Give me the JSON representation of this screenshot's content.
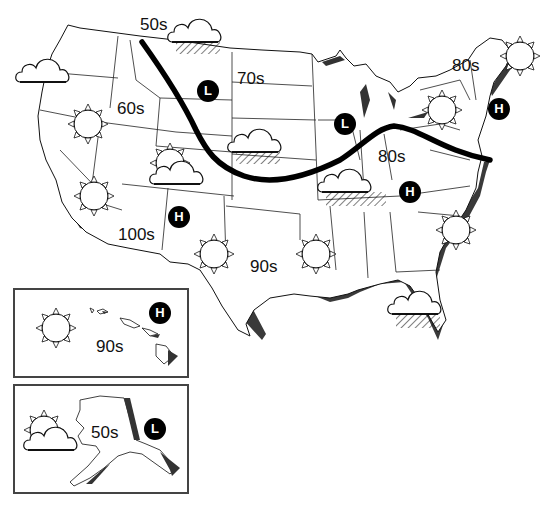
{
  "map": {
    "title": "",
    "temperature_labels": [
      {
        "id": "nw-50s",
        "text": "50s",
        "x": 140,
        "y": 16
      },
      {
        "id": "northplains-70s",
        "text": "70s",
        "x": 237,
        "y": 70
      },
      {
        "id": "northeast-80s",
        "text": "80s",
        "x": 452,
        "y": 57
      },
      {
        "id": "northwest-60s",
        "text": "60s",
        "x": 117,
        "y": 100
      },
      {
        "id": "midwest-80s",
        "text": "80s",
        "x": 378,
        "y": 148
      },
      {
        "id": "southwest-100s",
        "text": "100s",
        "x": 118,
        "y": 226
      },
      {
        "id": "south-90s",
        "text": "90s",
        "x": 250,
        "y": 258
      },
      {
        "id": "hawaii-90s",
        "text": "90s",
        "x": 96,
        "y": 338
      },
      {
        "id": "alaska-50s",
        "text": "50s",
        "x": 91,
        "y": 424
      }
    ],
    "pressure_systems": [
      {
        "id": "low-northplains",
        "type": "L",
        "x": 197,
        "y": 80
      },
      {
        "id": "low-greatlakes",
        "type": "L",
        "x": 334,
        "y": 113
      },
      {
        "id": "high-northeast",
        "type": "H",
        "x": 488,
        "y": 98
      },
      {
        "id": "high-appalachia",
        "type": "H",
        "x": 399,
        "y": 181
      },
      {
        "id": "high-southwest",
        "type": "H",
        "x": 168,
        "y": 206
      },
      {
        "id": "high-hawaii",
        "type": "H",
        "x": 149,
        "y": 302
      },
      {
        "id": "low-alaska",
        "type": "L",
        "x": 144,
        "y": 418
      }
    ],
    "weather_icons": [
      {
        "id": "cloud-rain-montana",
        "icon": "cloud-rain-icon",
        "x": 172,
        "y": 18
      },
      {
        "id": "cloud-washington",
        "icon": "cloud-icon",
        "x": 20,
        "y": 52
      },
      {
        "id": "sun-oregon",
        "icon": "sun-icon",
        "x": 68,
        "y": 105
      },
      {
        "id": "partly-cloudy-utah",
        "icon": "partly-cloudy-icon",
        "x": 152,
        "y": 145
      },
      {
        "id": "cloud-rain-nebraska",
        "icon": "cloud-rain-icon",
        "x": 232,
        "y": 118
      },
      {
        "id": "sun-california",
        "icon": "sun-icon",
        "x": 76,
        "y": 178
      },
      {
        "id": "sun-newmexico",
        "icon": "sun-icon",
        "x": 196,
        "y": 236
      },
      {
        "id": "sun-louisiana",
        "icon": "sun-icon",
        "x": 298,
        "y": 237
      },
      {
        "id": "cloud-rain-kentucky",
        "icon": "cloud-rain-icon",
        "x": 322,
        "y": 165
      },
      {
        "id": "sun-newyork",
        "icon": "sun-icon",
        "x": 424,
        "y": 94
      },
      {
        "id": "sun-maine",
        "icon": "sun-icon",
        "x": 504,
        "y": 40
      },
      {
        "id": "sun-carolina",
        "icon": "sun-icon",
        "x": 440,
        "y": 215
      },
      {
        "id": "cloud-rain-florida",
        "icon": "cloud-rain-icon",
        "x": 390,
        "y": 287
      },
      {
        "id": "sun-hawaii",
        "icon": "sun-icon",
        "x": 38,
        "y": 313
      },
      {
        "id": "partly-cloudy-alaska",
        "icon": "partly-cloudy-icon",
        "x": 24,
        "y": 415
      }
    ],
    "insets": [
      {
        "id": "hawaii-inset",
        "name": "Hawaii",
        "x": 13,
        "y": 288,
        "w": 176,
        "h": 90
      },
      {
        "id": "alaska-inset",
        "name": "Alaska",
        "x": 13,
        "y": 384,
        "w": 176,
        "h": 110
      }
    ],
    "colors": {
      "ink": "#000000",
      "state_lines": "#222222",
      "shadow": "#3a3a3a",
      "background": "#ffffff"
    }
  }
}
